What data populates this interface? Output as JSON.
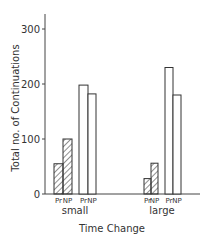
{
  "chart_data": {
    "type": "bar",
    "title": "",
    "xlabel": "Time Change",
    "ylabel": "Total no. of Continuations",
    "ylim": [
      0,
      300
    ],
    "yticks": [
      0,
      100,
      200,
      300
    ],
    "grid": false,
    "legend": null,
    "categories": [
      "small",
      "large"
    ],
    "bar_labels": [
      "Pr",
      "NP",
      "Pr",
      "NP"
    ],
    "series": [
      {
        "name": "Pr (hatched)",
        "style": "hatched",
        "values": [
          55,
          28
        ]
      },
      {
        "name": "NP (hatched)",
        "style": "hatched",
        "values": [
          100,
          56
        ]
      },
      {
        "name": "Pr (open)",
        "style": "open",
        "values": [
          198,
          230
        ]
      },
      {
        "name": "NP (open)",
        "style": "open",
        "values": [
          182,
          180
        ]
      }
    ]
  },
  "axis": {
    "y_title": "Total no. of Continuations",
    "x_title": "Time Change",
    "y_ticks": [
      "0",
      "100",
      "200",
      "300"
    ]
  },
  "groups": [
    {
      "label": "small",
      "bars": [
        {
          "label": "Pr",
          "value": 55,
          "style": "hatched"
        },
        {
          "label": "NP",
          "value": 100,
          "style": "hatched"
        },
        {
          "label": "Pr",
          "value": 198,
          "style": "open"
        },
        {
          "label": "NP",
          "value": 182,
          "style": "open"
        }
      ]
    },
    {
      "label": "large",
      "bars": [
        {
          "label": "Pr",
          "value": 28,
          "style": "hatched"
        },
        {
          "label": "NP",
          "value": 56,
          "style": "hatched"
        },
        {
          "label": "Pr",
          "value": 230,
          "style": "open"
        },
        {
          "label": "NP",
          "value": 180,
          "style": "open"
        }
      ]
    }
  ],
  "colors": {
    "ink": "#333333",
    "background": "#ffffff"
  }
}
